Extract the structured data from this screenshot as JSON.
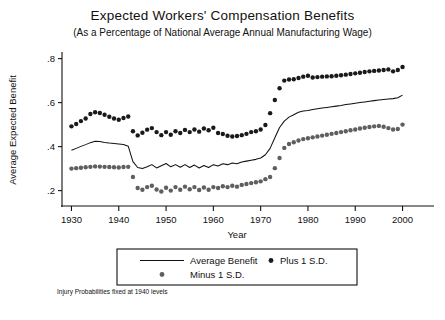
{
  "chart_data": {
    "type": "scatter",
    "title": "Expected Workers' Compensation  Benefits",
    "subtitle": "(As a Percentage of National Average Annual Manufacturing Wage)",
    "xlabel": "Year",
    "ylabel": "Average Expected Benefit",
    "note": "Injury Probabilities fixed at 1940 levels",
    "xlim": [
      1928,
      2002
    ],
    "ylim": [
      0.13,
      0.83
    ],
    "xticks": [
      1930,
      1940,
      1950,
      1960,
      1970,
      1980,
      1990,
      2000
    ],
    "xticklabels": [
      "1930",
      "1940",
      "1950",
      "1960",
      "1970",
      "1980",
      "1990",
      "2000"
    ],
    "yticks": [
      0.2,
      0.4,
      0.6,
      0.8
    ],
    "yticklabels": [
      ".2",
      ".4",
      ".6",
      ".8"
    ],
    "grid": false,
    "legend_position": "below-axes",
    "colors": {
      "average": "#111111",
      "plus": "#1a1a1a",
      "minus": "#5f5f5f",
      "frame": "#111111",
      "background": "#ffffff"
    },
    "x": [
      1930,
      1931,
      1932,
      1933,
      1934,
      1935,
      1936,
      1937,
      1938,
      1939,
      1940,
      1941,
      1942,
      1943,
      1944,
      1945,
      1946,
      1947,
      1948,
      1949,
      1950,
      1951,
      1952,
      1953,
      1954,
      1955,
      1956,
      1957,
      1958,
      1959,
      1960,
      1961,
      1962,
      1963,
      1964,
      1965,
      1966,
      1967,
      1968,
      1969,
      1970,
      1971,
      1972,
      1973,
      1974,
      1975,
      1976,
      1977,
      1978,
      1979,
      1980,
      1981,
      1982,
      1983,
      1984,
      1985,
      1986,
      1987,
      1988,
      1989,
      1990,
      1991,
      1992,
      1993,
      1994,
      1995,
      1996,
      1997,
      1998,
      1999,
      2000
    ],
    "series": [
      {
        "name": "Average Benefit",
        "style": "line",
        "values": [
          0.383,
          0.392,
          0.401,
          0.409,
          0.418,
          0.424,
          0.423,
          0.419,
          0.416,
          0.414,
          0.412,
          0.41,
          0.402,
          0.332,
          0.305,
          0.3,
          0.308,
          0.318,
          0.303,
          0.313,
          0.323,
          0.308,
          0.318,
          0.306,
          0.318,
          0.305,
          0.316,
          0.303,
          0.314,
          0.305,
          0.318,
          0.312,
          0.322,
          0.318,
          0.325,
          0.322,
          0.33,
          0.334,
          0.338,
          0.342,
          0.348,
          0.363,
          0.392,
          0.44,
          0.487,
          0.516,
          0.534,
          0.545,
          0.556,
          0.562,
          0.564,
          0.569,
          0.572,
          0.575,
          0.578,
          0.581,
          0.584,
          0.587,
          0.591,
          0.594,
          0.597,
          0.6,
          0.603,
          0.606,
          0.609,
          0.612,
          0.614,
          0.616,
          0.618,
          0.622,
          0.634
        ]
      },
      {
        "name": "Plus 1 S.D.",
        "style": "points",
        "values": [
          0.492,
          0.503,
          0.516,
          0.528,
          0.548,
          0.556,
          0.553,
          0.545,
          0.536,
          0.528,
          0.522,
          0.53,
          0.537,
          0.47,
          0.451,
          0.463,
          0.477,
          0.484,
          0.466,
          0.452,
          0.466,
          0.454,
          0.47,
          0.462,
          0.476,
          0.466,
          0.478,
          0.468,
          0.482,
          0.474,
          0.486,
          0.462,
          0.457,
          0.449,
          0.446,
          0.448,
          0.452,
          0.458,
          0.466,
          0.47,
          0.478,
          0.498,
          0.552,
          0.612,
          0.665,
          0.7,
          0.705,
          0.706,
          0.712,
          0.718,
          0.722,
          0.714,
          0.716,
          0.718,
          0.719,
          0.72,
          0.722,
          0.724,
          0.727,
          0.73,
          0.733,
          0.736,
          0.739,
          0.742,
          0.744,
          0.746,
          0.748,
          0.751,
          0.742,
          0.748,
          0.762
        ]
      },
      {
        "name": "Minus 1 S.D.",
        "style": "points",
        "values": [
          0.3,
          0.302,
          0.304,
          0.306,
          0.308,
          0.31,
          0.309,
          0.308,
          0.307,
          0.306,
          0.305,
          0.307,
          0.308,
          0.262,
          0.212,
          0.204,
          0.216,
          0.222,
          0.205,
          0.196,
          0.213,
          0.2,
          0.216,
          0.204,
          0.218,
          0.206,
          0.216,
          0.203,
          0.214,
          0.204,
          0.216,
          0.212,
          0.22,
          0.216,
          0.222,
          0.218,
          0.226,
          0.23,
          0.234,
          0.238,
          0.242,
          0.252,
          0.262,
          0.302,
          0.348,
          0.394,
          0.412,
          0.42,
          0.428,
          0.434,
          0.438,
          0.442,
          0.446,
          0.45,
          0.454,
          0.458,
          0.462,
          0.466,
          0.47,
          0.474,
          0.478,
          0.482,
          0.486,
          0.489,
          0.492,
          0.494,
          0.49,
          0.484,
          0.478,
          0.48,
          0.5
        ]
      }
    ]
  },
  "legend": {
    "items": [
      {
        "label": "Average Benefit",
        "marker": "line"
      },
      {
        "label": "Plus 1 S.D.",
        "marker": "dot-dark"
      },
      {
        "label": "Minus 1 S.D.",
        "marker": "dot-gray"
      }
    ]
  }
}
